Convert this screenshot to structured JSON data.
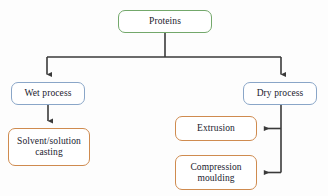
{
  "diagram": {
    "type": "flowchart",
    "background_color": "#fdfdfd",
    "connector_color": "#3a3a3a",
    "nodes": [
      {
        "id": "proteins",
        "label": "Proteins",
        "border_color": "#73a86b",
        "fill_color": "#ffffff",
        "level": 0
      },
      {
        "id": "wet_process",
        "label": "Wet process",
        "border_color": "#8aa6c8",
        "fill_color": "#ffffff",
        "level": 1
      },
      {
        "id": "dry_process",
        "label": "Dry process",
        "border_color": "#8aa6c8",
        "fill_color": "#ffffff",
        "level": 1
      },
      {
        "id": "solvent_casting",
        "label": "Solvent/solution\ncasting",
        "border_color": "#cf8b4f",
        "fill_color": "#ffffff",
        "level": 2
      },
      {
        "id": "extrusion",
        "label": "Extrusion",
        "border_color": "#cf8b4f",
        "fill_color": "#ffffff",
        "level": 2
      },
      {
        "id": "compression_moulding",
        "label": "Compression\nmoulding",
        "border_color": "#cf8b4f",
        "fill_color": "#ffffff",
        "level": 2
      }
    ],
    "edges": [
      {
        "from": "proteins",
        "to": "wet_process",
        "arrow": "down"
      },
      {
        "from": "proteins",
        "to": "dry_process",
        "arrow": "down"
      },
      {
        "from": "wet_process",
        "to": "solvent_casting",
        "arrow": "down"
      },
      {
        "from": "dry_process",
        "to": "extrusion",
        "arrow": "left"
      },
      {
        "from": "dry_process",
        "to": "compression_moulding",
        "arrow": "left"
      }
    ]
  }
}
